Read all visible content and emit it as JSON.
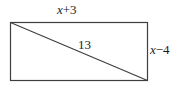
{
  "figure": {
    "type": "geometry-diagram",
    "shape": "rectangle-with-diagonal",
    "background_color": "#ffffff",
    "stroke_color": "#3f3f3f",
    "text_color": "#1c1c1c",
    "rectangle": {
      "x": 10,
      "y": 22,
      "width": 138,
      "height": 59
    },
    "diagonal": {
      "x1": 10,
      "y1": 22,
      "x2": 148,
      "y2": 81
    },
    "labels": {
      "top": {
        "full": "x+3",
        "variable": "x",
        "operator": "+3",
        "position": "above-top-edge"
      },
      "right": {
        "full": "x−4",
        "variable": "x",
        "operator": "−4",
        "position": "right-of-right-edge"
      },
      "diagonal": {
        "full": "13",
        "position": "above-diagonal-midpoint"
      }
    }
  }
}
